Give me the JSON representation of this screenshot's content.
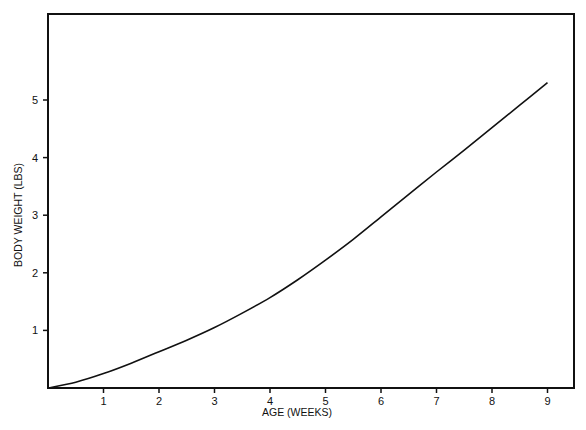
{
  "chart_data": {
    "type": "line",
    "title": "",
    "xlabel": "AGE (WEEKS)",
    "ylabel": "BODY WEIGHT (LBS)",
    "xlim": [
      0,
      9.5
    ],
    "ylim": [
      0,
      6.1
    ],
    "grid": false,
    "legend": null,
    "x_ticks": [
      1,
      2,
      3,
      4,
      5,
      6,
      7,
      8,
      9
    ],
    "y_ticks": [
      1,
      2,
      3,
      4,
      5
    ],
    "series": [
      {
        "name": "Body weight",
        "color": "#111111",
        "x": [
          0,
          0.5,
          1,
          1.5,
          2,
          2.5,
          3,
          3.5,
          4,
          4.5,
          5,
          5.5,
          6,
          6.5,
          7,
          7.5,
          8,
          8.5,
          9
        ],
        "values": [
          0.0,
          0.1,
          0.25,
          0.43,
          0.63,
          0.83,
          1.05,
          1.3,
          1.57,
          1.88,
          2.22,
          2.58,
          2.97,
          3.36,
          3.75,
          4.13,
          4.52,
          4.91,
          5.3
        ]
      }
    ]
  }
}
